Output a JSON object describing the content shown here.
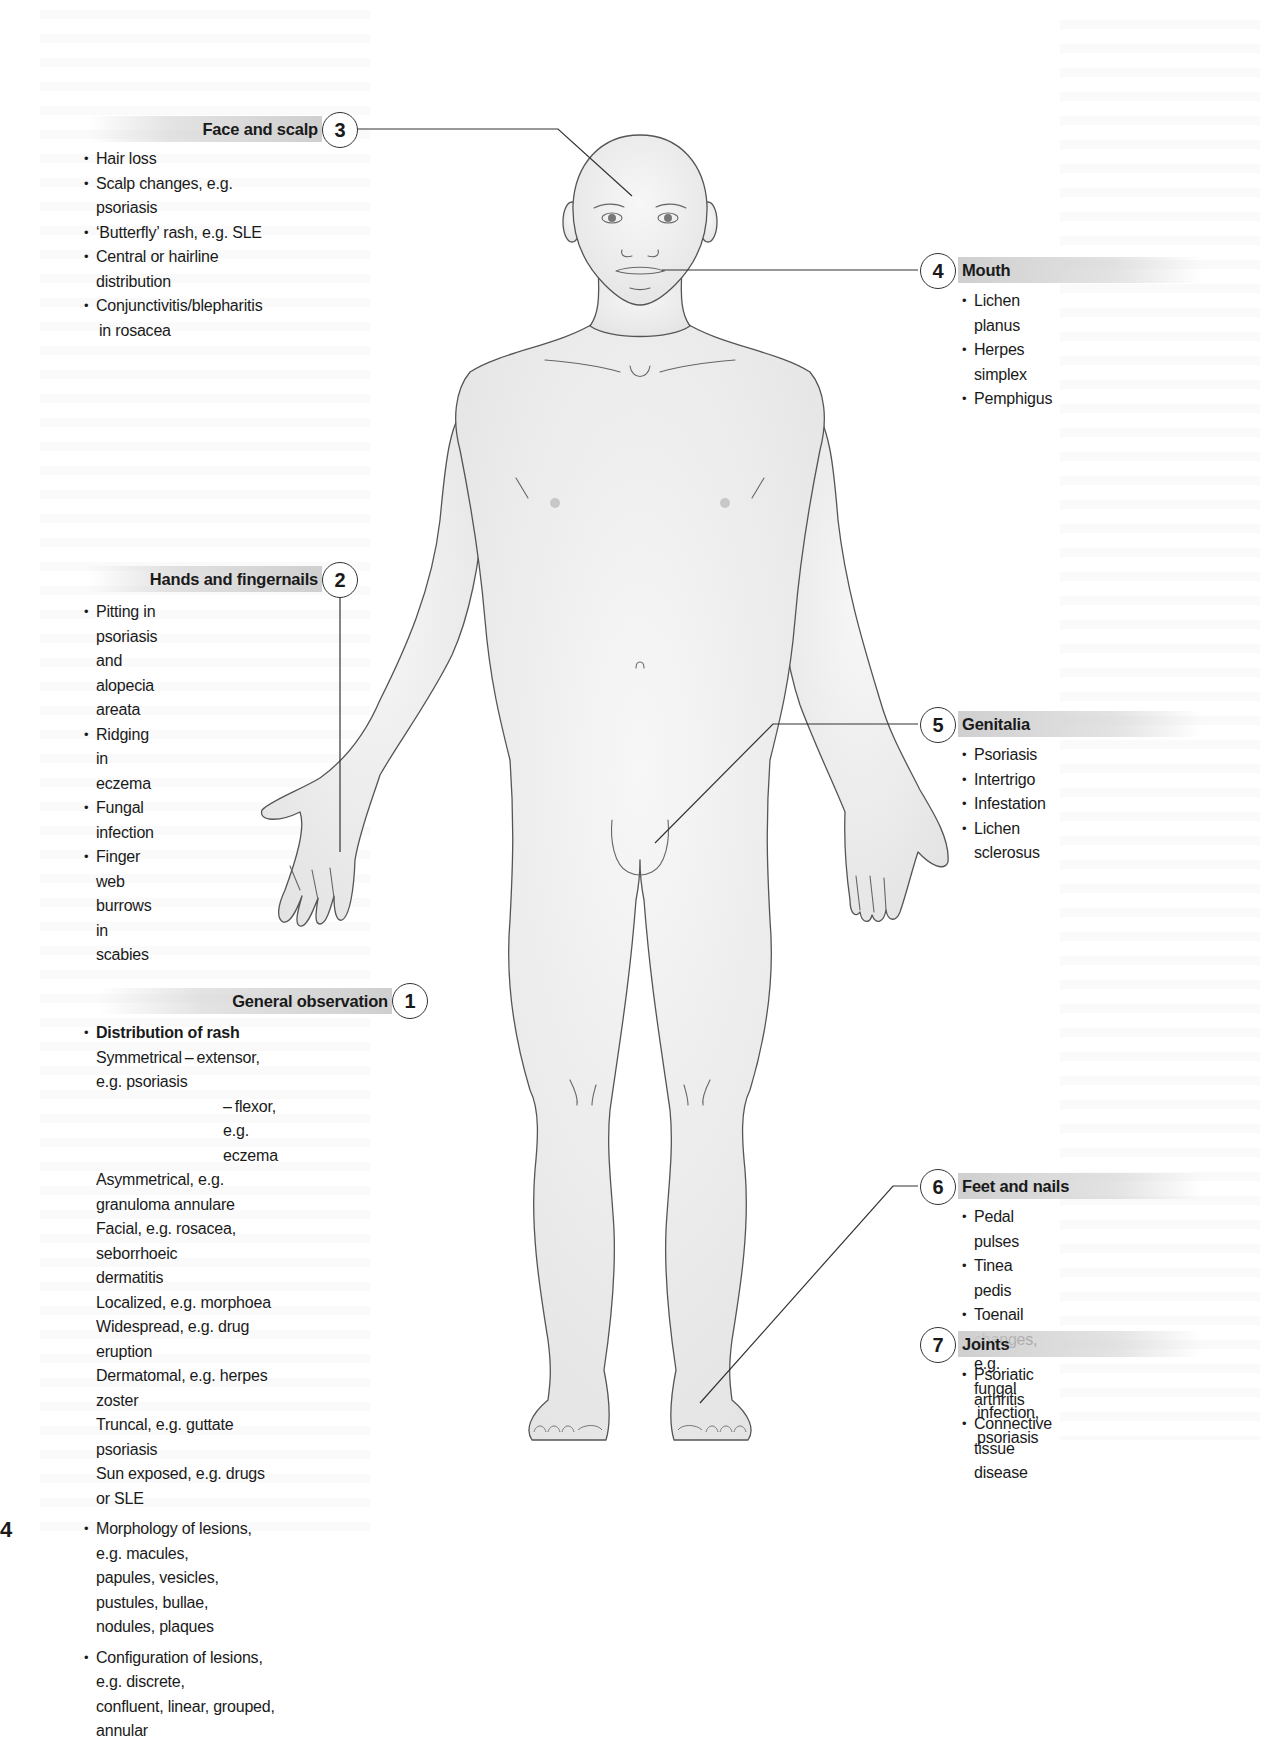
{
  "page_number": "4",
  "callouts": {
    "general_observation": {
      "number": "1",
      "title": "General observation",
      "items": [
        {
          "text": "Distribution of rash",
          "style": "bullet-bold"
        },
        {
          "text": "Symmetrical – extensor, e.g. psoriasis",
          "style": "sub"
        },
        {
          "text": "– flexor, e.g. eczema",
          "style": "sub2"
        },
        {
          "text": "Asymmetrical, e.g. granuloma annulare",
          "style": "sub"
        },
        {
          "text": "Facial, e.g. rosacea, seborrhoeic",
          "style": "sub"
        },
        {
          "text": "dermatitis",
          "style": "sub"
        },
        {
          "text": "Localized, e.g. morphoea",
          "style": "sub"
        },
        {
          "text": "Widespread, e.g. drug eruption",
          "style": "sub"
        },
        {
          "text": "Dermatomal, e.g. herpes zoster",
          "style": "sub"
        },
        {
          "text": "Truncal, e.g. guttate psoriasis",
          "style": "sub"
        },
        {
          "text": "Sun exposed, e.g. drugs or SLE",
          "style": "sub"
        },
        {
          "text": "Morphology of lesions, e.g. macules,",
          "style": "bullet-gap"
        },
        {
          "text": "papules, vesicles, pustules, bullae,",
          "style": "sub"
        },
        {
          "text": "nodules, plaques",
          "style": "sub"
        },
        {
          "text": "Configuration of lesions, e.g. discrete,",
          "style": "bullet-gap"
        },
        {
          "text": "confluent, linear, grouped, annular",
          "style": "sub"
        }
      ]
    },
    "hands": {
      "number": "2",
      "title": "Hands and fingernails",
      "items": [
        {
          "text": "Pitting in psoriasis and alopecia",
          "style": "bullet"
        },
        {
          "text": "areata",
          "style": "sub"
        },
        {
          "text": "Ridging in eczema",
          "style": "bullet"
        },
        {
          "text": "Fungal infection",
          "style": "bullet"
        },
        {
          "text": "Finger web burrows in scabies",
          "style": "bullet"
        }
      ]
    },
    "face": {
      "number": "3",
      "title": "Face and scalp",
      "items": [
        {
          "text": "Hair loss",
          "style": "bullet"
        },
        {
          "text": "Scalp changes, e.g. psoriasis",
          "style": "bullet"
        },
        {
          "text": "‘Butterfly’ rash, e.g. SLE",
          "style": "bullet"
        },
        {
          "text": "Central or hairline distribution",
          "style": "bullet"
        },
        {
          "text": "Conjunctivitis/blepharitis",
          "style": "bullet"
        },
        {
          "text": "in rosacea",
          "style": "sub"
        }
      ]
    },
    "mouth": {
      "number": "4",
      "title": "Mouth",
      "items": [
        {
          "text": "Lichen planus",
          "style": "bullet"
        },
        {
          "text": "Herpes simplex",
          "style": "bullet"
        },
        {
          "text": "Pemphigus",
          "style": "bullet"
        }
      ]
    },
    "genitalia": {
      "number": "5",
      "title": "Genitalia",
      "items": [
        {
          "text": "Psoriasis",
          "style": "bullet"
        },
        {
          "text": "Intertrigo",
          "style": "bullet"
        },
        {
          "text": "Infestation",
          "style": "bullet"
        },
        {
          "text": "Lichen sclerosus",
          "style": "bullet"
        }
      ]
    },
    "feet": {
      "number": "6",
      "title": "Feet and nails",
      "items": [
        {
          "text": "Pedal pulses",
          "style": "bullet"
        },
        {
          "text": "Tinea pedis",
          "style": "bullet"
        },
        {
          "text": "Toenail changes, e.g. fungal",
          "style": "bullet"
        },
        {
          "text": "infection, psoriasis",
          "style": "sub"
        }
      ]
    },
    "joints": {
      "number": "7",
      "title": "Joints",
      "items": [
        {
          "text": "Psoriatic arthritis",
          "style": "bullet"
        },
        {
          "text": "Connective tissue disease",
          "style": "bullet"
        }
      ]
    }
  },
  "colors": {
    "header_bar": "#cfcfcf",
    "line": "#333333",
    "body_fill": "#ececec",
    "body_outline": "#555555"
  }
}
